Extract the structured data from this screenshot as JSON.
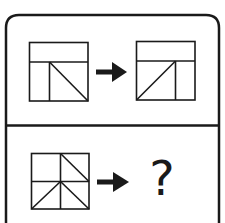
{
  "puzzle": {
    "type": "figure-analogy",
    "colors": {
      "stroke": "#1a1a1a",
      "background": "#ffffff"
    },
    "example_row": {
      "source_figure": {
        "description": "square with top band; lower area split by a vertical line at left; diagonal from top-left of right cell to bottom-right corner"
      },
      "arrow": "arrow-right",
      "result_figure": {
        "description": "square with top band; lower area split by a vertical line at right; diagonal from bottom-left corner to top-right of left cell"
      }
    },
    "question_row": {
      "source_figure": {
        "description": "square divided into four quadrants; diagonal in top-right quadrant from top-left to bottom-right; two diagonals from center down to the bottom corners"
      },
      "arrow": "arrow-right",
      "answer_label": "?"
    }
  }
}
